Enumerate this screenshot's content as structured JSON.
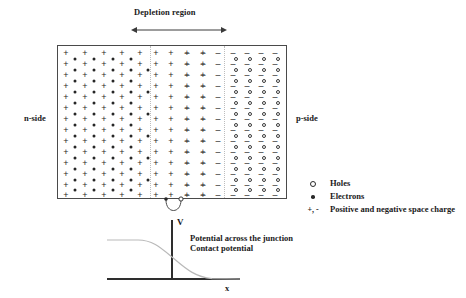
{
  "figure": {
    "title_top": "Depletion region",
    "side_labels": {
      "left": "n-side",
      "right": "p-side"
    }
  },
  "legend": {
    "items": [
      {
        "symbol": "o",
        "icon": "hole-open-circle-icon",
        "label": "Holes"
      },
      {
        "symbol": "•",
        "icon": "electron-filled-dot-icon",
        "label": "Electrons"
      },
      {
        "symbol": "+, -",
        "icon": "plus-minus-icon",
        "label": "Positive and negative space charge"
      }
    ]
  },
  "potential_plot": {
    "y_axis_label": "V",
    "x_axis_label": "x",
    "caption_line_1": "Potential across the junction",
    "caption_line_2": "Contact potential"
  },
  "colors": {
    "ink": "#262626",
    "block_border": "#4a4a4a",
    "axis": "#3a3a3a",
    "curve": "#b9b9b9",
    "boundary": "#bdbdbd"
  },
  "chart_data": {
    "type": "line",
    "title": "Potential across the junction",
    "xlabel": "x",
    "ylabel": "V",
    "series": [
      {
        "name": "Contact potential",
        "x": [
          107,
          120,
          133,
          145,
          155,
          163,
          172,
          181,
          190,
          200,
          212,
          226,
          240
        ],
        "y": [
          240,
          240,
          240,
          241,
          244,
          249,
          256,
          263,
          269,
          274,
          277,
          279,
          279
        ]
      }
    ]
  },
  "structure": {
    "block": {
      "x": 57,
      "y": 45,
      "width": 230,
      "height": 154
    },
    "depletion_arrow": {
      "x1": 134,
      "x2": 224,
      "y": 30
    },
    "junction_x": 172,
    "plus_columns_x": [
      65,
      84,
      103,
      121,
      139,
      155,
      170,
      186,
      202
    ],
    "minus_columns_x": [
      186,
      202,
      217,
      232,
      246,
      260,
      274
    ],
    "rows_y": [
      52,
      63,
      74,
      85,
      96,
      107,
      118,
      129,
      140,
      151,
      162,
      173,
      184,
      194
    ],
    "electron_columns_x": [
      74,
      93,
      112,
      130,
      147
    ],
    "hole_columns_x": [
      239,
      253,
      267,
      281
    ]
  }
}
